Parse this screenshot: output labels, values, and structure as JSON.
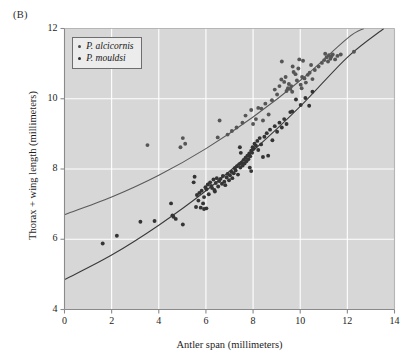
{
  "panel": {
    "label": "(B)"
  },
  "axes": {
    "xlabel": "Antler span (millimeters)",
    "ylabel": "Thorax + wing length (millimeters)",
    "xticks": [
      "0",
      "2",
      "4",
      "6",
      "8",
      "10",
      "12",
      "14"
    ],
    "yticks": [
      "4",
      "6",
      "8",
      "10",
      "12"
    ]
  },
  "legend": {
    "items": [
      {
        "label": "P. alcicornis",
        "color": "#4a4a4a"
      },
      {
        "label": "P. mouldsi",
        "color": "#2e2e2e"
      }
    ]
  },
  "colors": {
    "plot_background": "#d7d7d7",
    "gridline": "#ffffff",
    "frame": "#8a8a8a",
    "curve_alcicornis": "#5a5a5a",
    "curve_mouldsi": "#3a3a3a",
    "point_alcicornis": "#565656",
    "point_mouldsi": "#343434"
  },
  "chart_data": {
    "type": "scatter",
    "title": "(B)",
    "xlabel": "Antler span (millimeters)",
    "ylabel": "Thorax + wing length (millimeters)",
    "xlim": [
      0,
      14
    ],
    "ylim": [
      4,
      12
    ],
    "xticks": [
      0,
      2,
      4,
      6,
      8,
      10,
      12,
      14
    ],
    "yticks": [
      4,
      6,
      8,
      10,
      12
    ],
    "grid": true,
    "legend_position": "top-left",
    "series": [
      {
        "name": "P. alcicornis",
        "marker": "circle",
        "color": "#565656",
        "points": [
          [
            3.52,
            8.68
          ],
          [
            4.92,
            8.62
          ],
          [
            5.02,
            8.88
          ],
          [
            5.12,
            8.72
          ],
          [
            6.5,
            8.9
          ],
          [
            6.58,
            9.38
          ],
          [
            7.1,
            9.08
          ],
          [
            7.55,
            9.32
          ],
          [
            7.68,
            9.52
          ],
          [
            7.92,
            9.68
          ],
          [
            8.0,
            9.28
          ],
          [
            8.12,
            9.42
          ],
          [
            8.35,
            9.72
          ],
          [
            8.52,
            9.86
          ],
          [
            8.66,
            9.55
          ],
          [
            8.8,
            9.96
          ],
          [
            8.92,
            10.26
          ],
          [
            9.02,
            10.12
          ],
          [
            9.12,
            10.36
          ],
          [
            9.2,
            10.55
          ],
          [
            9.22,
            11.06
          ],
          [
            9.32,
            10.48
          ],
          [
            9.38,
            10.62
          ],
          [
            9.42,
            10.22
          ],
          [
            9.48,
            10.3
          ],
          [
            9.52,
            10.42
          ],
          [
            9.58,
            10.28
          ],
          [
            9.62,
            10.36
          ],
          [
            9.66,
            10.2
          ],
          [
            9.72,
            10.76
          ],
          [
            9.8,
            10.7
          ],
          [
            9.86,
            10.52
          ],
          [
            9.92,
            10.86
          ],
          [
            9.96,
            11.12
          ],
          [
            10.02,
            10.4
          ],
          [
            10.08,
            10.62
          ],
          [
            10.12,
            11.08
          ],
          [
            10.18,
            10.58
          ],
          [
            10.24,
            10.46
          ],
          [
            10.32,
            10.68
          ],
          [
            10.4,
            10.74
          ],
          [
            10.52,
            10.56
          ],
          [
            10.62,
            10.82
          ],
          [
            10.78,
            10.92
          ],
          [
            10.92,
            11.02
          ],
          [
            11.02,
            11.1
          ],
          [
            11.12,
            11.18
          ],
          [
            11.18,
            11.06
          ],
          [
            11.22,
            11.24
          ],
          [
            11.28,
            11.14
          ],
          [
            11.32,
            11.2
          ],
          [
            11.38,
            11.26
          ],
          [
            11.48,
            11.12
          ],
          [
            11.58,
            11.22
          ],
          [
            11.72,
            11.26
          ],
          [
            12.28,
            11.34
          ],
          [
            8.22,
            9.74
          ],
          [
            8.42,
            9.38
          ],
          [
            6.92,
            8.98
          ],
          [
            7.3,
            9.18
          ],
          [
            9.68,
            10.92
          ],
          [
            10.06,
            10.3
          ],
          [
            10.46,
            10.96
          ],
          [
            11.06,
            11.28
          ]
        ]
      },
      {
        "name": "P. mouldsi",
        "marker": "circle",
        "color": "#343434",
        "points": [
          [
            1.62,
            5.88
          ],
          [
            2.22,
            6.1
          ],
          [
            3.22,
            6.5
          ],
          [
            3.82,
            6.52
          ],
          [
            4.52,
            7.02
          ],
          [
            4.58,
            6.68
          ],
          [
            4.62,
            6.64
          ],
          [
            4.72,
            6.58
          ],
          [
            5.02,
            6.42
          ],
          [
            5.48,
            7.62
          ],
          [
            5.52,
            7.78
          ],
          [
            5.58,
            6.92
          ],
          [
            5.62,
            7.26
          ],
          [
            5.68,
            7.1
          ],
          [
            5.72,
            7.32
          ],
          [
            5.78,
            6.9
          ],
          [
            5.82,
            7.38
          ],
          [
            5.88,
            7.02
          ],
          [
            5.92,
            6.86
          ],
          [
            5.98,
            7.48
          ],
          [
            6.02,
            7.42
          ],
          [
            6.08,
            7.56
          ],
          [
            6.12,
            7.28
          ],
          [
            6.18,
            7.62
          ],
          [
            6.22,
            7.52
          ],
          [
            6.26,
            7.46
          ],
          [
            6.32,
            7.7
          ],
          [
            6.36,
            7.4
          ],
          [
            6.42,
            7.6
          ],
          [
            6.46,
            7.74
          ],
          [
            6.52,
            7.5
          ],
          [
            6.56,
            7.66
          ],
          [
            6.62,
            7.72
          ],
          [
            6.68,
            7.58
          ],
          [
            6.72,
            7.8
          ],
          [
            6.78,
            7.64
          ],
          [
            6.82,
            7.54
          ],
          [
            6.88,
            7.76
          ],
          [
            6.92,
            7.86
          ],
          [
            6.98,
            7.68
          ],
          [
            7.02,
            7.82
          ],
          [
            7.08,
            7.92
          ],
          [
            7.12,
            7.74
          ],
          [
            7.18,
            7.88
          ],
          [
            7.22,
            8.02
          ],
          [
            7.26,
            7.96
          ],
          [
            7.32,
            8.08
          ],
          [
            7.36,
            7.84
          ],
          [
            7.42,
            8.14
          ],
          [
            7.46,
            8.04
          ],
          [
            7.52,
            8.18
          ],
          [
            7.56,
            8.1
          ],
          [
            7.6,
            8.26
          ],
          [
            7.64,
            8.16
          ],
          [
            7.68,
            8.32
          ],
          [
            7.72,
            8.22
          ],
          [
            7.76,
            8.38
          ],
          [
            7.8,
            8.28
          ],
          [
            7.84,
            8.44
          ],
          [
            7.88,
            8.36
          ],
          [
            7.92,
            8.52
          ],
          [
            7.96,
            8.46
          ],
          [
            7.98,
            8.62
          ],
          [
            7.92,
            7.94
          ],
          [
            8.02,
            8.58
          ],
          [
            8.06,
            8.72
          ],
          [
            8.12,
            8.66
          ],
          [
            8.18,
            8.8
          ],
          [
            8.22,
            8.54
          ],
          [
            8.28,
            8.88
          ],
          [
            8.34,
            8.7
          ],
          [
            8.42,
            8.34
          ],
          [
            8.48,
            8.92
          ],
          [
            8.58,
            9.02
          ],
          [
            8.64,
            8.38
          ],
          [
            8.72,
            9.12
          ],
          [
            8.82,
            8.82
          ],
          [
            8.92,
            9.22
          ],
          [
            9.02,
            9.06
          ],
          [
            9.12,
            9.32
          ],
          [
            9.22,
            9.18
          ],
          [
            9.32,
            9.42
          ],
          [
            9.42,
            9.28
          ],
          [
            9.58,
            9.62
          ],
          [
            9.66,
            9.64
          ],
          [
            9.82,
            9.98
          ],
          [
            10.02,
            9.82
          ],
          [
            10.22,
            10.02
          ],
          [
            10.38,
            9.8
          ],
          [
            10.52,
            10.2
          ],
          [
            6.02,
            6.88
          ],
          [
            6.38,
            7.36
          ],
          [
            5.92,
            7.2
          ],
          [
            7.44,
            8.62
          ],
          [
            7.48,
            8.46
          ],
          [
            7.86,
            8.04
          ]
        ]
      }
    ],
    "fitted_curves": [
      {
        "name": "P. alcicornis fit",
        "color": "#5a5a5a",
        "description": "upper allometric curve, y = 6.70 at x=0 rising to ~12 near x=12.6",
        "anchors": [
          [
            0,
            6.7
          ],
          [
            2,
            7.2
          ],
          [
            4,
            7.82
          ],
          [
            6,
            8.58
          ],
          [
            8,
            9.48
          ],
          [
            10,
            10.52
          ],
          [
            12,
            11.72
          ],
          [
            12.7,
            12.0
          ]
        ]
      },
      {
        "name": "P. mouldsi fit",
        "color": "#3a3a3a",
        "description": "lower allometric curve, y = 4.85 at x=0 rising to ~12 near x=13.6",
        "anchors": [
          [
            0,
            4.85
          ],
          [
            2,
            5.55
          ],
          [
            4,
            6.4
          ],
          [
            6,
            7.38
          ],
          [
            8,
            8.52
          ],
          [
            10,
            9.78
          ],
          [
            12,
            11.18
          ],
          [
            13.55,
            12.0
          ]
        ]
      }
    ]
  }
}
